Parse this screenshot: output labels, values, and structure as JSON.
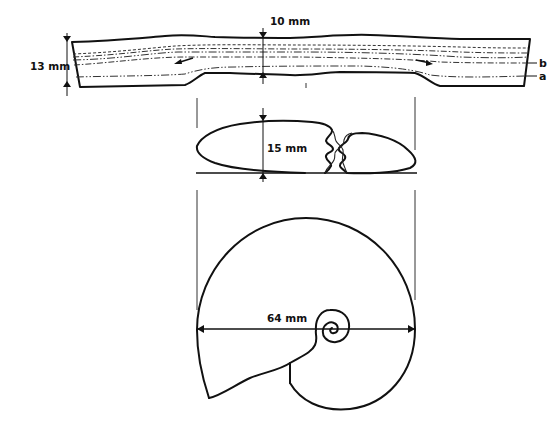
{
  "figure": {
    "type": "technical-drawing"
  },
  "band_section": {
    "thickness_label": "13 mm",
    "thin_thickness_label": "10 mm",
    "layer_labels": {
      "upper": "b",
      "lower": "a"
    },
    "flow_arrows": [
      "left",
      "right"
    ]
  },
  "cross_section": {
    "height_label": "15 mm"
  },
  "shell_view": {
    "diameter_label": "64 mm"
  },
  "colors": {
    "line": "#111111",
    "background": "#ffffff"
  }
}
